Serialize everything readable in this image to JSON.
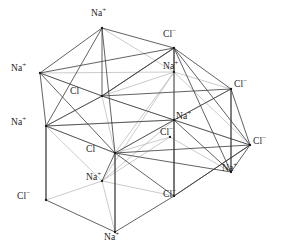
{
  "figure": {
    "background_color": "#ffffff",
    "edge_color_front": "#3a3a3a",
    "edge_color_back": "#b9b9b9",
    "label_color": "#1a1a1a",
    "width": 282,
    "height": 252
  },
  "chart_data": {
    "type": "scatter",
    "xlabel": "",
    "ylabel": "",
    "xlim": [
      0,
      282
    ],
    "ylim": [
      0,
      252
    ],
    "grid": false,
    "legend": "none",
    "series": [
      {
        "name": "Na+ ions",
        "label": "Na",
        "charge": "+",
        "color": "#1a1a1a",
        "points": [
          {
            "id": "na_top",
            "x": 102,
            "y": 28
          },
          {
            "id": "na_left_upper",
            "x": 40,
            "y": 73
          },
          {
            "id": "na_mid_upper_right",
            "x": 174,
            "y": 72
          },
          {
            "id": "na_left_mid",
            "x": 46,
            "y": 126
          },
          {
            "id": "na_center_right",
            "x": 174,
            "y": 120
          },
          {
            "id": "na_lower_center",
            "x": 102,
            "y": 181
          },
          {
            "id": "na_right_lower",
            "x": 231,
            "y": 172
          },
          {
            "id": "na_bottom",
            "x": 115,
            "y": 232
          }
        ]
      },
      {
        "name": "Cl- ions",
        "label": "Cl",
        "charge": "−",
        "color": "#1a1a1a",
        "points": [
          {
            "id": "cl_top_right",
            "x": 174,
            "y": 48
          },
          {
            "id": "cl_center",
            "x": 102,
            "y": 96
          },
          {
            "id": "cl_right_upper",
            "x": 231,
            "y": 89
          },
          {
            "id": "cl_center_lower",
            "x": 170,
            "y": 137
          },
          {
            "id": "cl_left_lower",
            "x": 115,
            "y": 153
          },
          {
            "id": "cl_right_lower",
            "x": 250,
            "y": 145
          },
          {
            "id": "cl_bottom_left",
            "x": 46,
            "y": 200
          },
          {
            "id": "cl_bottom_mid",
            "x": 174,
            "y": 196
          }
        ]
      }
    ]
  },
  "labels": [
    {
      "name": "label-na-top",
      "text": "Na",
      "charge": "+",
      "x": 91,
      "y": 9,
      "species": "na"
    },
    {
      "name": "label-cl-top-right",
      "text": "Cl",
      "charge": "−",
      "x": 163,
      "y": 30,
      "species": "cl"
    },
    {
      "name": "label-na-left-upper",
      "text": "Na",
      "charge": "+",
      "x": 11,
      "y": 64,
      "species": "na"
    },
    {
      "name": "label-na-mid-upper",
      "text": "Na",
      "charge": "+",
      "x": 163,
      "y": 62,
      "species": "na"
    },
    {
      "name": "label-cl-right-upper",
      "text": "Cl",
      "charge": "−",
      "x": 234,
      "y": 80,
      "species": "cl"
    },
    {
      "name": "label-cl-center",
      "text": "Cl",
      "charge": "",
      "x": 70,
      "y": 87,
      "species": "cl"
    },
    {
      "name": "label-na-left-mid",
      "text": "Na",
      "charge": "+",
      "x": 11,
      "y": 118,
      "species": "na"
    },
    {
      "name": "label-na-center-right",
      "text": "Na",
      "charge": "+",
      "x": 176,
      "y": 112,
      "species": "na"
    },
    {
      "name": "label-cl-center-lower",
      "text": "Cl",
      "charge": "−",
      "x": 160,
      "y": 128,
      "species": "cl"
    },
    {
      "name": "label-cl-right-lower",
      "text": "Cl",
      "charge": "−",
      "x": 253,
      "y": 137,
      "species": "cl"
    },
    {
      "name": "label-cl-left-lower",
      "text": "Cl",
      "charge": "",
      "x": 86,
      "y": 145,
      "species": "cl"
    },
    {
      "name": "label-na-lower-center",
      "text": "Na",
      "charge": "+",
      "x": 86,
      "y": 173,
      "species": "na"
    },
    {
      "name": "label-na-right-lower",
      "text": "Na",
      "charge": "+",
      "x": 222,
      "y": 164,
      "species": "na"
    },
    {
      "name": "label-cl-bottom-left",
      "text": "Cl",
      "charge": "−",
      "x": 17,
      "y": 192,
      "species": "cl"
    },
    {
      "name": "label-cl-bottom-mid",
      "text": "Cl",
      "charge": "−",
      "x": 163,
      "y": 190,
      "species": "cl"
    },
    {
      "name": "label-na-bottom",
      "text": "Na",
      "charge": "+",
      "x": 104,
      "y": 233,
      "species": "na"
    }
  ],
  "edges": {
    "back": [
      [
        40,
        73,
        174,
        72
      ],
      [
        40,
        73,
        102,
        96
      ],
      [
        174,
        72,
        231,
        89
      ],
      [
        102,
        96,
        174,
        72
      ],
      [
        174,
        72,
        174,
        120
      ],
      [
        102,
        96,
        174,
        120
      ],
      [
        46,
        126,
        174,
        120
      ],
      [
        174,
        120,
        231,
        89
      ],
      [
        102,
        28,
        174,
        72
      ],
      [
        174,
        48,
        174,
        120
      ],
      [
        115,
        153,
        174,
        120
      ],
      [
        102,
        181,
        174,
        120
      ],
      [
        102,
        181,
        170,
        137
      ],
      [
        46,
        200,
        102,
        181
      ],
      [
        102,
        181,
        174,
        196
      ],
      [
        102,
        181,
        115,
        232
      ],
      [
        170,
        137,
        231,
        172
      ],
      [
        115,
        153,
        170,
        137
      ],
      [
        46,
        126,
        102,
        96
      ],
      [
        46,
        126,
        115,
        153
      ],
      [
        174,
        72,
        250,
        145
      ],
      [
        102,
        96,
        46,
        126
      ],
      [
        174,
        120,
        250,
        145
      ],
      [
        231,
        89,
        174,
        120
      ],
      [
        102,
        96,
        115,
        153
      ],
      [
        102,
        181,
        46,
        126
      ],
      [
        174,
        72,
        115,
        153
      ],
      [
        174,
        72,
        102,
        181
      ],
      [
        174,
        120,
        174,
        196
      ]
    ],
    "front": [
      [
        102,
        28,
        40,
        73
      ],
      [
        102,
        28,
        174,
        48
      ],
      [
        102,
        28,
        102,
        96
      ],
      [
        102,
        28,
        46,
        126
      ],
      [
        102,
        28,
        115,
        153
      ],
      [
        174,
        48,
        231,
        89
      ],
      [
        174,
        48,
        174,
        72
      ],
      [
        174,
        48,
        102,
        96
      ],
      [
        174,
        48,
        174,
        120
      ],
      [
        174,
        48,
        250,
        145
      ],
      [
        174,
        48,
        231,
        172
      ],
      [
        40,
        73,
        46,
        126
      ],
      [
        40,
        73,
        102,
        96
      ],
      [
        40,
        73,
        115,
        153
      ],
      [
        40,
        73,
        174,
        48
      ],
      [
        102,
        96,
        231,
        89
      ],
      [
        102,
        96,
        174,
        120
      ],
      [
        102,
        96,
        46,
        126
      ],
      [
        231,
        89,
        250,
        145
      ],
      [
        231,
        89,
        174,
        120
      ],
      [
        231,
        89,
        231,
        172
      ],
      [
        46,
        126,
        174,
        120
      ],
      [
        46,
        126,
        115,
        153
      ],
      [
        46,
        126,
        46,
        200
      ],
      [
        174,
        120,
        250,
        145
      ],
      [
        174,
        120,
        231,
        172
      ],
      [
        174,
        120,
        115,
        153
      ],
      [
        174,
        120,
        174,
        196
      ],
      [
        115,
        153,
        174,
        196
      ],
      [
        115,
        153,
        102,
        181
      ],
      [
        115,
        153,
        231,
        172
      ],
      [
        115,
        153,
        250,
        145
      ],
      [
        115,
        153,
        115,
        232
      ],
      [
        250,
        145,
        231,
        172
      ],
      [
        250,
        145,
        174,
        196
      ],
      [
        46,
        200,
        115,
        232
      ],
      [
        115,
        232,
        174,
        196
      ],
      [
        174,
        196,
        250,
        145
      ],
      [
        46,
        200,
        46,
        126
      ],
      [
        115,
        232,
        115,
        153
      ],
      [
        231,
        172,
        231,
        89
      ],
      [
        174,
        196,
        174,
        120
      ],
      [
        102,
        96,
        174,
        48
      ]
    ]
  }
}
